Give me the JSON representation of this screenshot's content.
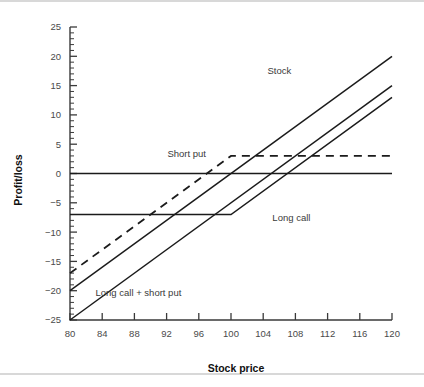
{
  "chart_data": {
    "type": "line",
    "title": "",
    "xlabel": "Stock price",
    "ylabel": "Profit/loss",
    "xlim": [
      80,
      120
    ],
    "ylim": [
      -25,
      25
    ],
    "xticks": [
      80,
      84,
      88,
      92,
      96,
      100,
      104,
      108,
      112,
      116,
      120
    ],
    "xtick_labels": [
      "80",
      "84",
      "88",
      "92",
      "96",
      "100",
      "104",
      "108",
      "112",
      "116",
      "120"
    ],
    "yticks": [
      -25,
      -20,
      -15,
      -10,
      -5,
      0,
      5,
      10,
      15,
      20,
      25
    ],
    "ytick_labels": [
      "−25",
      "−20",
      "−15",
      "−10",
      "−5",
      "0",
      "5",
      "10",
      "15",
      "20",
      "25"
    ],
    "x_minor_step": 1,
    "y_minor_step": 1,
    "grid": false,
    "legend": "inline-annotations",
    "strike": 100,
    "series": [
      {
        "name": "Stock",
        "style": "solid",
        "label_x": 106,
        "label_y": 17.5,
        "points": [
          [
            80,
            -20
          ],
          [
            120,
            20
          ]
        ]
      },
      {
        "name": "Long call",
        "style": "solid",
        "label_x": 107.5,
        "label_y": -7.6,
        "points": [
          [
            80,
            -7
          ],
          [
            100,
            -7
          ],
          [
            120,
            13
          ]
        ]
      },
      {
        "name": "Short put",
        "style": "dashed",
        "label_x": 96.5,
        "label_y": 3.2,
        "points": [
          [
            80,
            -17
          ],
          [
            100,
            3
          ],
          [
            120,
            3
          ]
        ]
      },
      {
        "name": "Long call + short put",
        "style": "solid",
        "label_x": 91.5,
        "label_y": -20.5,
        "points": [
          [
            80,
            -25
          ],
          [
            120,
            15
          ]
        ]
      },
      {
        "name": "zero-reference",
        "style": "solid-reference",
        "points": [
          [
            80,
            0
          ],
          [
            120,
            0
          ]
        ]
      }
    ],
    "annotations": [
      {
        "text": "Stock",
        "x": 106,
        "y": 17.5
      },
      {
        "text": "Short put",
        "x": 94.5,
        "y": 3.4
      },
      {
        "text": "Long call",
        "x": 107.5,
        "y": -7.6
      },
      {
        "text": "Long call + short put",
        "x": 88.5,
        "y": -20.3
      }
    ],
    "colors": {
      "line": "#1b1b1b",
      "axis": "#3a3a3a",
      "tick_label": "#4a4a4a",
      "axis_title": "#111111",
      "background": "#ffffff",
      "rule": "#d8d8d8"
    }
  }
}
